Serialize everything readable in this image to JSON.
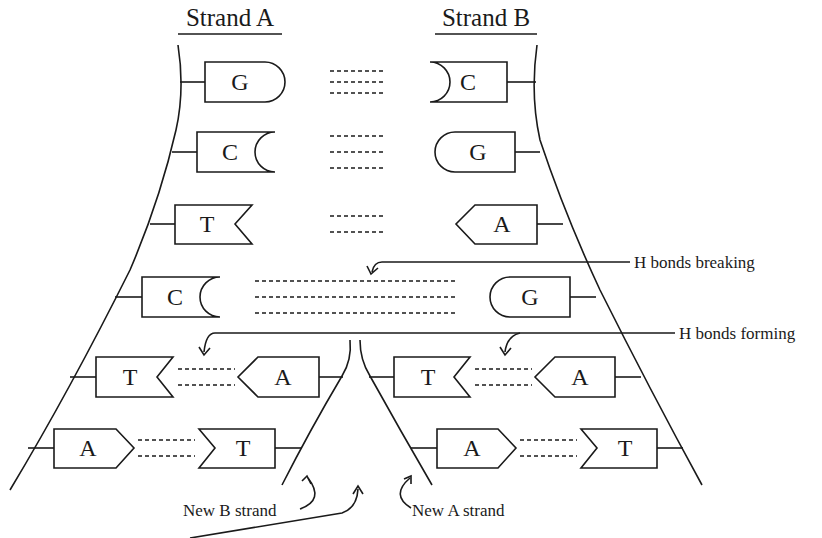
{
  "titles": {
    "strand_a": "Strand A",
    "strand_b": "Strand B"
  },
  "labels": {
    "h_bonds_breaking": "H bonds breaking",
    "h_bonds_forming": "H bonds forming",
    "new_b_strand": "New B strand",
    "new_a_strand": "New A strand"
  },
  "base_pairs": [
    {
      "row": 1,
      "left": "G",
      "right": "C",
      "h_bonds": 3,
      "state": "paired"
    },
    {
      "row": 2,
      "left": "C",
      "right": "G",
      "h_bonds": 3,
      "state": "paired"
    },
    {
      "row": 3,
      "left": "T",
      "right": "A",
      "h_bonds": 2,
      "state": "paired"
    },
    {
      "row": 4,
      "left": "C",
      "right": "G",
      "h_bonds": 3,
      "state": "breaking"
    }
  ],
  "new_pairs": {
    "left_fork": [
      {
        "row": 5,
        "template": "T",
        "new": "A",
        "h_bonds": 2
      },
      {
        "row": 6,
        "template": "A",
        "new": "T",
        "h_bonds": 2
      }
    ],
    "right_fork": [
      {
        "row": 5,
        "new": "T",
        "template": "A",
        "h_bonds": 2
      },
      {
        "row": 6,
        "new": "A",
        "template": "T",
        "h_bonds": 2
      }
    ]
  },
  "colors": {
    "ink": "#1a1a1a",
    "background": "#ffffff"
  }
}
